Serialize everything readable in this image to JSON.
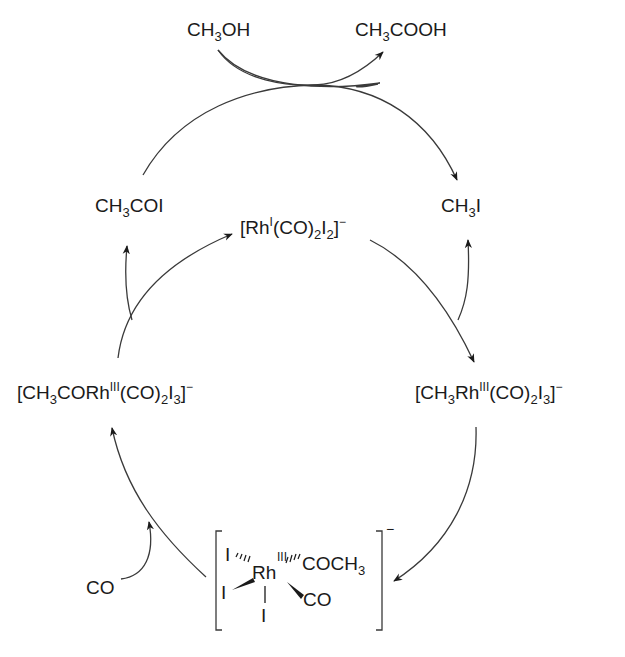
{
  "diagram": {
    "type": "catalytic-cycle",
    "title": "",
    "colors": {
      "ink": "#1a1a1a",
      "background": "#ffffff"
    },
    "outer_cycle": {
      "reactant": {
        "formula": "CH3OH",
        "parts": [
          [
            "CH",
            ""
          ],
          [
            "3",
            "sub"
          ],
          [
            "OH",
            ""
          ]
        ]
      },
      "product": {
        "formula": "CH3COOH",
        "parts": [
          [
            "CH",
            ""
          ],
          [
            "3",
            "sub"
          ],
          [
            "COOH",
            ""
          ]
        ]
      },
      "left_species": {
        "formula": "CH3COI",
        "parts": [
          [
            "CH",
            ""
          ],
          [
            "3",
            "sub"
          ],
          [
            "COI",
            ""
          ]
        ]
      },
      "right_species": {
        "formula": "CH3I",
        "parts": [
          [
            "CH",
            ""
          ],
          [
            "3",
            "sub"
          ],
          [
            "I",
            ""
          ]
        ]
      }
    },
    "inner_cycle": {
      "catalyst": {
        "formula": "[RhI(CO)2I2]-",
        "parts": [
          [
            "[Rh",
            ""
          ],
          [
            "I",
            "sup"
          ],
          [
            "(CO)",
            ""
          ],
          [
            "2",
            "sub"
          ],
          [
            "I",
            ""
          ],
          [
            "2",
            "sub"
          ],
          [
            "]",
            ""
          ],
          [
            "−",
            "sup"
          ]
        ]
      },
      "oxidative_addition_product": {
        "formula": "[CH3RhIII(CO)2I3]-",
        "parts": [
          [
            "[CH",
            ""
          ],
          [
            "3",
            "sub"
          ],
          [
            "Rh",
            ""
          ],
          [
            "III",
            "sup"
          ],
          [
            "(CO)",
            ""
          ],
          [
            "2",
            "sub"
          ],
          [
            "I",
            ""
          ],
          [
            "3",
            "sub"
          ],
          [
            "]",
            ""
          ],
          [
            "−",
            "sup"
          ]
        ]
      },
      "acyl_complex": {
        "formula": "[CH3CORhIII(CO)2I3]-",
        "parts": [
          [
            "[CH",
            ""
          ],
          [
            "3",
            "sub"
          ],
          [
            "CORh",
            ""
          ],
          [
            "III",
            "sup"
          ],
          [
            "(CO)",
            ""
          ],
          [
            "2",
            "sub"
          ],
          [
            "I",
            ""
          ],
          [
            "3",
            "sub"
          ],
          [
            "]",
            ""
          ],
          [
            "−",
            "sup"
          ]
        ]
      },
      "co_reagent": {
        "formula": "CO"
      },
      "intermediate_structure": {
        "metal": "Rh",
        "oxidation_state": "III",
        "ligands": {
          "top_left": "I",
          "left": "I",
          "bottom": "I",
          "top_right": "COCH3",
          "bottom_right": "CO"
        },
        "charge": "−"
      }
    },
    "arrows": [
      {
        "from": "CH3OH",
        "to": "CH3COOH",
        "kind": "curved"
      },
      {
        "from": "CH3COI",
        "to": "CH3I",
        "kind": "arc"
      },
      {
        "from": "[CH3CORhIII(CO)2I3]-",
        "to": "[RhI(CO)2I2]-",
        "kind": "arc"
      },
      {
        "from": "[CH3CORhIII(CO)2I3]-",
        "to": "CH3COI",
        "kind": "branch"
      },
      {
        "from": "[RhI(CO)2I2]-",
        "to": "[CH3RhIII(CO)2I3]-",
        "kind": "arc"
      },
      {
        "from": "CH3I",
        "to": "[RhI(CO)2I2]-",
        "kind": "branch-in"
      },
      {
        "from": "[CH3RhIII(CO)2I3]-",
        "to": "intermediate",
        "kind": "arc"
      },
      {
        "from": "intermediate",
        "to": "[CH3CORhIII(CO)2I3]-",
        "kind": "arc"
      },
      {
        "from": "CO",
        "to": "intermediate-arc",
        "kind": "branch-in"
      }
    ]
  }
}
